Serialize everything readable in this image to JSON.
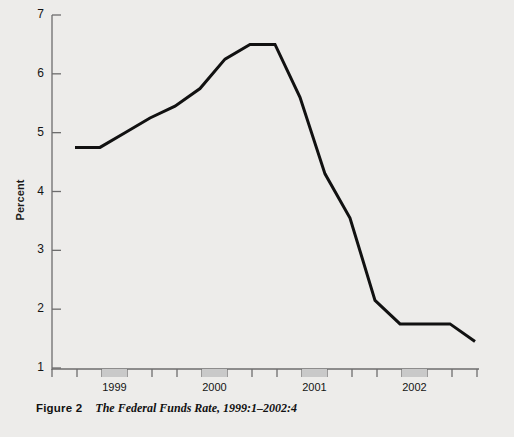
{
  "figure": {
    "label": "Figure 2",
    "title": "The Federal Funds Rate, 1999:1–2002:4"
  },
  "chart_data": {
    "type": "line",
    "title": "The Federal Funds Rate, 1999:1–2002:4",
    "xlabel": "",
    "ylabel": "Percent",
    "ylim": [
      1,
      7
    ],
    "yticks": [
      1,
      2,
      3,
      4,
      5,
      6,
      7
    ],
    "ytick_labels": [
      "1",
      "2",
      "3",
      "4",
      "5",
      "6",
      "7"
    ],
    "xtick_labels": [
      "1999",
      "2000",
      "2001",
      "2002"
    ],
    "grid": false,
    "legend": null,
    "line_color": "#111111",
    "line_width": 3,
    "x": [
      "1998:4",
      "1999:1",
      "1999:2",
      "1999:3",
      "1999:4",
      "2000:1",
      "2000:2",
      "2000:3",
      "2000:4",
      "2001:1",
      "2001:2",
      "2001:3",
      "2001:4",
      "2002:1",
      "2002:2",
      "2002:3",
      "2002:4"
    ],
    "values": [
      4.75,
      4.75,
      5.0,
      5.25,
      5.45,
      5.75,
      6.25,
      6.5,
      6.5,
      5.6,
      4.3,
      3.55,
      2.15,
      1.75,
      1.75,
      1.75,
      1.45
    ],
    "series": [
      {
        "name": "Federal Funds Rate",
        "values": [
          4.75,
          4.75,
          5.0,
          5.25,
          5.45,
          5.75,
          6.25,
          6.5,
          6.5,
          5.6,
          4.3,
          3.55,
          2.15,
          1.75,
          1.75,
          1.75,
          1.45
        ]
      }
    ],
    "year_band_color": "#c9c9c9",
    "axis_color": "#6d6d6d"
  }
}
